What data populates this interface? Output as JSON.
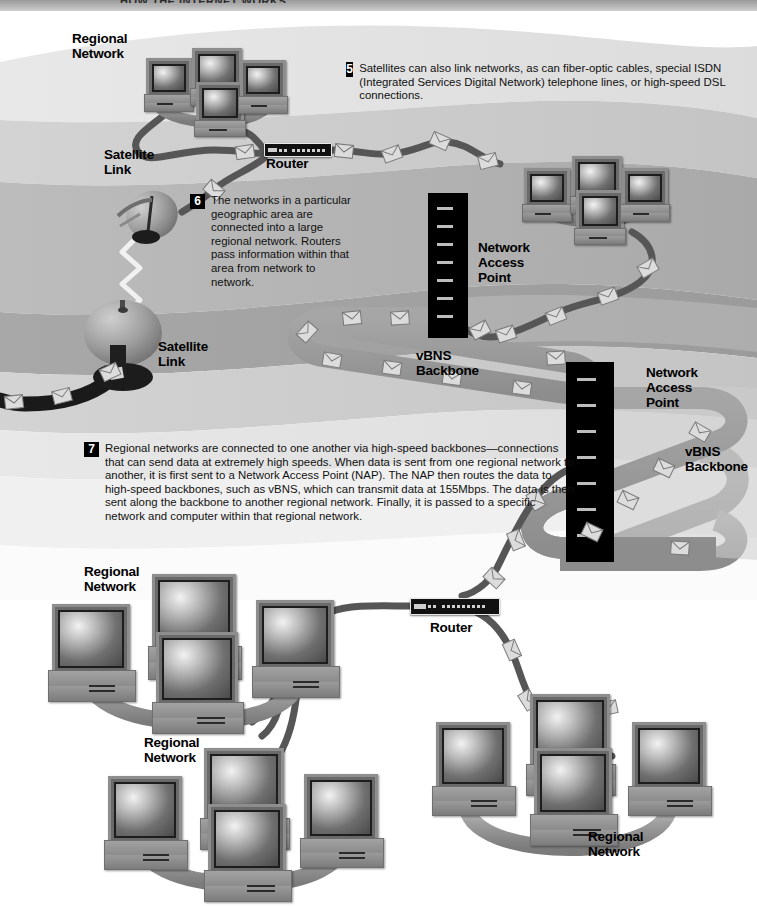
{
  "banner": {
    "text": "HOW THE INTERNET WORKS"
  },
  "callouts": [
    {
      "number": "5",
      "text": "Satellites can also link networks, as can fiber-optic cables, special ISDN (Integrated Services Digital Network) telephone lines, or high-speed DSL connections."
    },
    {
      "number": "6",
      "text": "The networks in a particular geographic area are connected into a large regional network. Routers pass information within that area from network to network."
    },
    {
      "number": "7",
      "text": "Regional networks are connected to one another via high-speed backbones—connections that can send data at extremely high speeds. When data is sent from one regional network to another, it is first sent to a Network Access Point (NAP). The NAP then routes the data to high-speed backbones, such as vBNS, which can transmit data at 155Mbps. The data is then sent along the backbone to another regional network. Finally, it is passed to a specific network and computer within that regional network."
    }
  ],
  "labels": {
    "regional_network_top": "Regional\nNetwork",
    "regional_network_bottom_left": "Regional\nNetwork",
    "regional_network_bottom_mid": "Regional\nNetwork",
    "regional_network_bottom_right": "Regional\nNetwork",
    "satellite_link_upper": "Satellite\nLink",
    "satellite_link_lower": "Satellite\nLink",
    "router_top": "Router",
    "router_bottom": "Router",
    "nap_upper": "Network\nAccess\nPoint",
    "nap_lower": "Network\nAccess\nPoint",
    "vbns_upper": "vBNS\nBackbone",
    "vbns_lower": "vBNS\nBackbone"
  },
  "figures": {
    "speed_mention": "155Mbps",
    "backbone_name": "vBNS",
    "nap_abbrev": "NAP"
  },
  "colors": {
    "page_background": "#ffffff",
    "band_light": "#e4e4e4",
    "band_mid": "#c9c9c9",
    "band_dark": "#b0b0b0",
    "band_darker": "#9d9d9d",
    "cable_dark": "#4e4e4e",
    "cable_black": "#111111",
    "backbone_road": "#9a9a9a",
    "nap_body": "#000000",
    "text": "#101010",
    "callout_badge_bg": "#000000",
    "callout_badge_fg": "#ffffff",
    "banner": "#b4b4b4"
  }
}
